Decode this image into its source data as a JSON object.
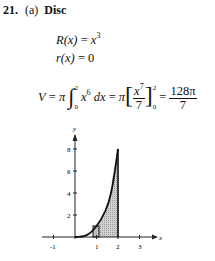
{
  "problem": {
    "number": "21.",
    "part": "(a)",
    "method": "Disc"
  },
  "equations": {
    "outer_radius": {
      "lhs": "R(x)",
      "eq": " = ",
      "base": "x",
      "exp": "3"
    },
    "inner_radius": {
      "lhs": "r(x)",
      "eq": " = ",
      "rhs": "0"
    },
    "volume": {
      "lhs": "V",
      "eq": " = ",
      "pi": "π",
      "integral": "∫",
      "upper": "2",
      "lower": "0",
      "integrand_base": "x",
      "integrand_exp": "6",
      "dx": " dx",
      "antideriv_num_base": "x",
      "antideriv_num_exp": "7",
      "antideriv_den": "7",
      "bracket_open": "[",
      "bracket_close": "]",
      "result_num": "128π",
      "result_den": "7"
    }
  },
  "graph": {
    "x_axis_label": "x",
    "y_axis_label": "y",
    "x_ticks": [
      "-1",
      "1",
      "2",
      "3"
    ],
    "y_ticks": [
      "2",
      "4",
      "6",
      "8"
    ],
    "curve": "y = x^3",
    "shaded_region": {
      "x_from": 1,
      "x_to": 2
    },
    "representative_rectangle": {
      "x_from": 0.9,
      "x_to": 1.1
    },
    "colors": {
      "curve": "#111111",
      "shade": "#c9c9c9",
      "axis": "#222222"
    }
  }
}
